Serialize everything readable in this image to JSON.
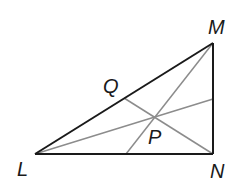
{
  "diagram": {
    "type": "triangle-with-cevians",
    "colors": {
      "triangle_stroke": "#1a1a1a",
      "cevian_stroke": "#8c8c8c",
      "label": "#1a1a1a",
      "background": "#ffffff"
    },
    "vertices": {
      "L": {
        "label": "L",
        "x": 35,
        "y": 154
      },
      "M": {
        "label": "M",
        "x": 213,
        "y": 43
      },
      "N": {
        "label": "N",
        "x": 213,
        "y": 154
      }
    },
    "points": {
      "Q": {
        "label": "Q",
        "x": 124,
        "y": 98
      },
      "P": {
        "label": "P",
        "x": 155,
        "y": 117
      }
    },
    "labels": [
      {
        "id": "L",
        "text": "L",
        "x": 17,
        "y": 176
      },
      {
        "id": "M",
        "text": "M",
        "x": 208,
        "y": 34
      },
      {
        "id": "N",
        "text": "N",
        "x": 210,
        "y": 178
      },
      {
        "id": "Q",
        "text": "Q",
        "x": 103,
        "y": 93
      },
      {
        "id": "P",
        "text": "P",
        "x": 148,
        "y": 144
      }
    ]
  }
}
